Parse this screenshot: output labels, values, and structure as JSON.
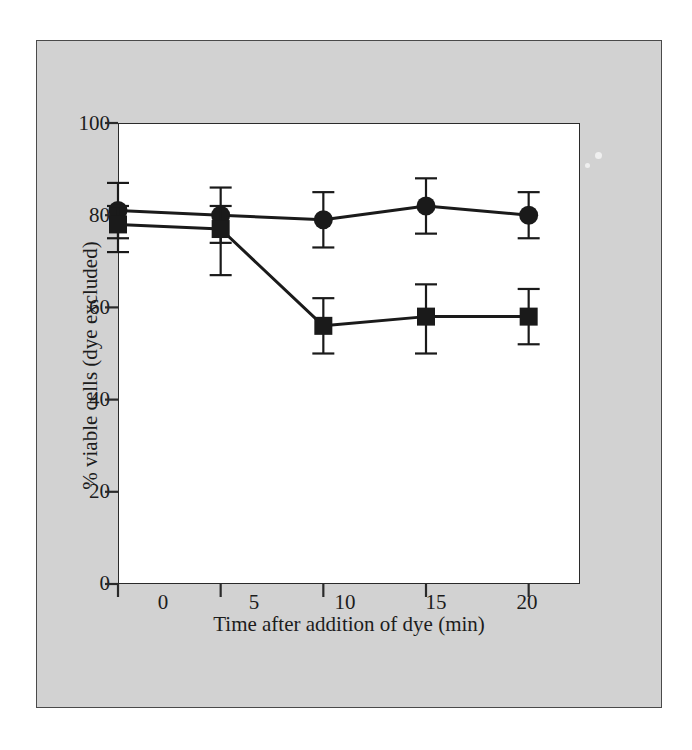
{
  "figure": {
    "background_color": "#ffffff",
    "panel_color": "#d2d2d2",
    "plot_background_color": "#ffffff",
    "axis_color": "#2a2a2a",
    "series_color": "#1a1a1a"
  },
  "axes": {
    "x_title": "Time after addition of dye (min)",
    "y_title": "% viable cells (dye excluded)",
    "x_ticks": [
      "0",
      "5",
      "10",
      "15",
      "20"
    ],
    "y_ticks": [
      "0",
      "20",
      "40",
      "60",
      "80",
      "100"
    ]
  },
  "chart_data": {
    "type": "line",
    "title": "",
    "subtitle": "",
    "xlabel": "Time after addition of dye (min)",
    "ylabel": "% viable cells (dye excluded)",
    "xlim": [
      0,
      22.5
    ],
    "ylim": [
      0,
      100
    ],
    "xticks": [
      0,
      5,
      10,
      15,
      20
    ],
    "yticks": [
      0,
      20,
      40,
      60,
      80,
      100
    ],
    "grid": false,
    "legend": "none",
    "error_bars": true,
    "x": [
      0,
      5,
      10,
      15,
      20
    ],
    "series": [
      {
        "name": "circles",
        "marker": "circle",
        "values": [
          81,
          80,
          79,
          82,
          80
        ],
        "yerr_upper": [
          6,
          6,
          6,
          6,
          5
        ],
        "yerr_lower": [
          6,
          6,
          6,
          6,
          5
        ]
      },
      {
        "name": "squares",
        "marker": "square",
        "values": [
          78,
          77,
          56,
          58,
          58
        ],
        "yerr_upper": [
          4,
          5,
          6,
          7,
          6
        ],
        "yerr_lower": [
          6,
          10,
          6,
          8,
          6
        ]
      }
    ]
  }
}
